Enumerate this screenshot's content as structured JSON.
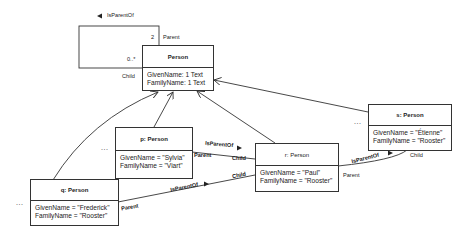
{
  "class_box": {
    "name": "Person",
    "attributes": [
      "GivenName: 1 Text",
      "FamilyName: 1 Text"
    ]
  },
  "self_association": {
    "name": "IsParentOf",
    "direction_arrow": "left",
    "parent_role": "Parent",
    "parent_multiplicity": "2",
    "child_role": "Child",
    "child_multiplicity": "0..*"
  },
  "instances": {
    "p": {
      "title": "p: Person",
      "attributes": [
        "GivenName = \"Sylvia\"",
        "FamilyName = \"Viart\""
      ],
      "ellipsis": "..."
    },
    "q": {
      "title": "q: Person",
      "attributes": [
        "GivenName = \"Frederick\"",
        "FamilyName = \"Rooster\""
      ],
      "ellipsis": "..."
    },
    "r": {
      "title": "r: Person",
      "attributes": [
        "GivenName = \"Paul\"",
        "FamilyName = \"Rooster\""
      ]
    },
    "s": {
      "title": "s: Person",
      "attributes": [
        "GivenName = \"Étienne\"",
        "FamilyName = \"Rooster\""
      ],
      "ellipsis": "..."
    }
  },
  "links": [
    {
      "from": "p",
      "to": "r",
      "name": "IsParentOf",
      "from_role": "Parent",
      "to_role": "Child"
    },
    {
      "from": "q",
      "to": "r",
      "name": "IsParentOf",
      "from_role": "Parent",
      "to_role": "Child"
    },
    {
      "from": "r",
      "to": "s",
      "name": "IsParentOf",
      "from_role": "Parent",
      "to_role": "Child"
    }
  ],
  "colors": {
    "line": "#333333",
    "text": "#222222",
    "background": "#ffffff"
  }
}
